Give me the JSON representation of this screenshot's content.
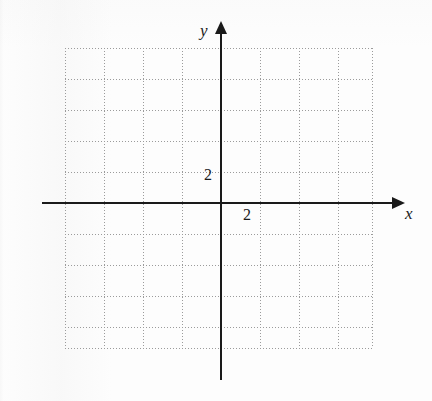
{
  "figure": {
    "type": "coordinate-grid",
    "background_color": "#fdfdfd",
    "axis_color": "#1a1a1a",
    "grid_color": "#9b9b9b"
  },
  "axes": {
    "x": {
      "label": "x",
      "arrow": "right",
      "tick_labels": [
        "2"
      ]
    },
    "y": {
      "label": "y",
      "arrow": "up",
      "tick_labels": [
        "2"
      ]
    }
  },
  "chart_data": {
    "type": "scatter",
    "title": "",
    "subtitle": "",
    "xlabel": "x",
    "ylabel": "y",
    "grid": true,
    "legend": null,
    "series": [
      {
        "name": "",
        "x": [],
        "y": []
      }
    ],
    "xlim": [
      -4,
      4
    ],
    "ylim": [
      -5,
      5
    ],
    "xticks": [
      2
    ],
    "xticklabels": [
      "2"
    ],
    "yticks": [
      2
    ],
    "yticklabels": [
      "2"
    ],
    "x_major_step": 2,
    "y_major_step": 2,
    "annotations": []
  },
  "grid": {
    "vertical_lines": [
      65,
      104,
      143,
      182,
      221,
      260,
      299,
      338,
      372
    ],
    "horizontal_lines": [
      48,
      79,
      110,
      141,
      172,
      203,
      234,
      265,
      296,
      327,
      348
    ]
  }
}
